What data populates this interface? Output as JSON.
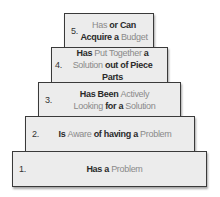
{
  "diagram": {
    "type": "pyramid",
    "levels": [
      {
        "number": "5.",
        "lines": [
          [
            {
              "text": "Has",
              "style": "light"
            },
            {
              "text": " or Can",
              "style": "dark"
            }
          ],
          [
            {
              "text": "Acquire a ",
              "style": "dark"
            },
            {
              "text": "Budget",
              "style": "light"
            }
          ]
        ],
        "full_text": "Has or Can Acquire a Budget"
      },
      {
        "number": "4.",
        "lines": [
          [
            {
              "text": "Has ",
              "style": "dark"
            },
            {
              "text": "Put Together",
              "style": "light"
            },
            {
              "text": " a",
              "style": "dark"
            }
          ],
          [
            {
              "text": "Solution",
              "style": "light"
            },
            {
              "text": " out of Piece Parts",
              "style": "dark"
            }
          ]
        ],
        "full_text": "Has Put Together a Solution out of Piece Parts"
      },
      {
        "number": "3.",
        "lines": [
          [
            {
              "text": "Has Been ",
              "style": "dark"
            },
            {
              "text": "Actively",
              "style": "light"
            }
          ],
          [
            {
              "text": "Looking",
              "style": "light"
            },
            {
              "text": " for a ",
              "style": "dark"
            },
            {
              "text": "Solution",
              "style": "light"
            }
          ]
        ],
        "full_text": "Has Been Actively Looking for a Solution"
      },
      {
        "number": "2.",
        "lines": [
          [
            {
              "text": "Is ",
              "style": "dark"
            },
            {
              "text": "Aware",
              "style": "light"
            },
            {
              "text": " of having a ",
              "style": "dark"
            },
            {
              "text": "Problem",
              "style": "light"
            }
          ]
        ],
        "full_text": "Is Aware of having a Problem"
      },
      {
        "number": "1.",
        "lines": [
          [
            {
              "text": "Has a ",
              "style": "dark"
            },
            {
              "text": "Problem",
              "style": "light"
            }
          ]
        ],
        "full_text": "Has a Problem"
      }
    ]
  },
  "colors": {
    "box_fill": "#ececec",
    "box_border": "#3a3a3a",
    "emphasis_text": "#2a2a2a",
    "muted_text": "#8a8a8a"
  }
}
